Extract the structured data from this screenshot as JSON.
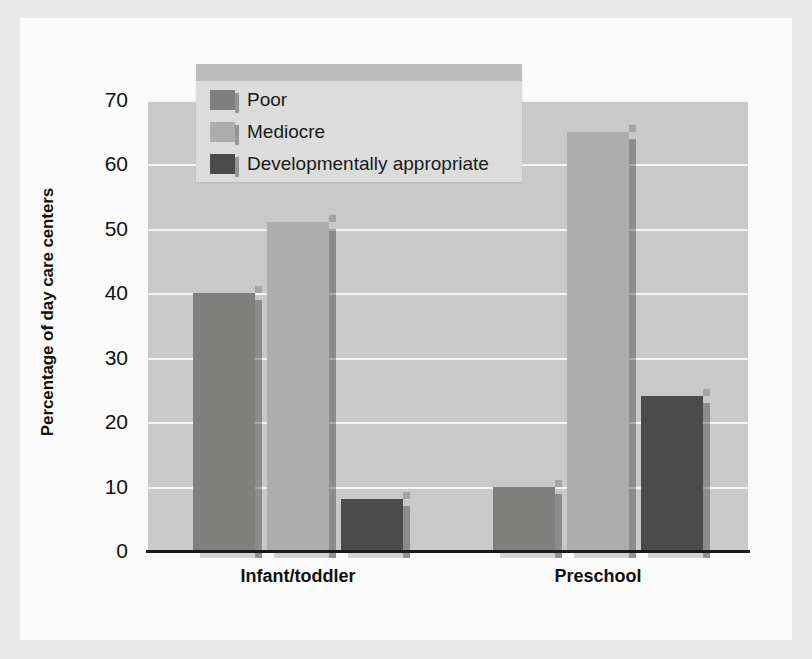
{
  "chart_data": {
    "type": "bar",
    "title": "",
    "subtitle": "",
    "xlabel": "",
    "ylabel": "Percentage of day care centers",
    "ylim": [
      0,
      70
    ],
    "ytick_step": 10,
    "yticks": [
      "70",
      "60",
      "50",
      "40",
      "30",
      "20",
      "10",
      "0"
    ],
    "grid": true,
    "legend_position": "top-center-inside",
    "categories": [
      "Infant/toddler",
      "Preschool"
    ],
    "series": [
      {
        "name": "Poor",
        "color": "#7f7f7d",
        "values": [
          40,
          10
        ]
      },
      {
        "name": "Mediocre",
        "color": "#adadad",
        "values": [
          51,
          65
        ]
      },
      {
        "name": "Developmentally appropriate",
        "color": "#4b4b4b",
        "values": [
          8,
          24
        ]
      }
    ],
    "plot_background": "#c9c9c9",
    "gridline_color": "#f4f4f4",
    "axis_color": "#1a1a1a",
    "frame_color": "#e8e8e8",
    "page_color": "#fbfbfb"
  }
}
